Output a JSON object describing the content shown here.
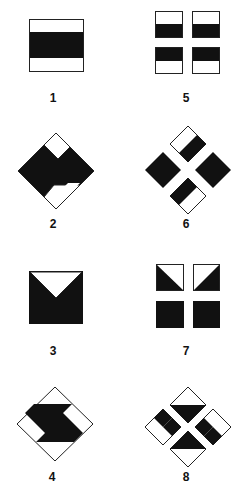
{
  "figure": {
    "colors": {
      "fill": "#111111",
      "stroke": "#222222",
      "background": "#ffffff"
    },
    "panels": [
      {
        "id": 1,
        "label": "1",
        "description": "square with horizontal black band across middle, white top and bottom strips"
      },
      {
        "id": 2,
        "label": "2",
        "description": "diamond, black with white strips at upper-left and lower-right edges"
      },
      {
        "id": 3,
        "label": "3",
        "description": "black square with white inverted triangle notch at top"
      },
      {
        "id": 4,
        "label": "4",
        "description": "diamond with black S-shaped zigzag band across middle"
      },
      {
        "id": 5,
        "label": "5",
        "description": "four small squares, each half black half white"
      },
      {
        "id": 6,
        "label": "6",
        "description": "four small diamonds arranged in cross, left and right black, top and bottom half black"
      },
      {
        "id": 7,
        "label": "7",
        "description": "four small squares; top two with diagonal black triangle, bottom two fully black"
      },
      {
        "id": 8,
        "label": "8",
        "description": "four small diamonds arranged in cross with black bands near center"
      }
    ]
  }
}
